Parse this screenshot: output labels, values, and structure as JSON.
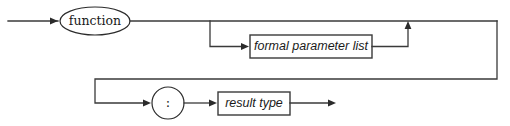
{
  "diagram": {
    "kind": "railroad-syntax-diagram",
    "canvas": {
      "width": 510,
      "height": 126,
      "background": "#ffffff"
    },
    "stroke_color": "#3a3a3a",
    "text_color": "#1a1a1a",
    "nodes": {
      "keyword_function": {
        "label": "function",
        "shape": "oval",
        "type": "terminal",
        "cx": 95,
        "cy": 21,
        "rx": 35,
        "ry": 14
      },
      "formal_parameter_list": {
        "label": "formal parameter list",
        "shape": "rect",
        "type": "nonterminal",
        "x": 250,
        "y": 35,
        "width": 122,
        "height": 23
      },
      "colon": {
        "label": ":",
        "shape": "circle",
        "type": "terminal",
        "cx": 168,
        "cy": 103,
        "r": 16
      },
      "result_type": {
        "label": "result type",
        "shape": "rect",
        "type": "nonterminal",
        "x": 218,
        "y": 92,
        "width": 72,
        "height": 23
      }
    },
    "edges": [
      {
        "name": "entry-line",
        "from": "start",
        "to": "keyword_function"
      },
      {
        "name": "function-to-branch",
        "from": "keyword_function",
        "to": "branch-point"
      },
      {
        "name": "optional-params-bypass",
        "from": "branch-point",
        "to": "merge-point"
      },
      {
        "name": "branch-down-to-params",
        "from": "branch-point",
        "to": "formal_parameter_list"
      },
      {
        "name": "params-up-to-merge",
        "from": "formal_parameter_list",
        "to": "merge-point"
      },
      {
        "name": "wrap-right-down",
        "from": "merge-point",
        "to": "row2-start"
      },
      {
        "name": "row2-down-to-colon",
        "from": "row2-start",
        "to": "colon"
      },
      {
        "name": "colon-to-result-type",
        "from": "colon",
        "to": "result_type"
      },
      {
        "name": "exit-line",
        "from": "result_type",
        "to": "end"
      }
    ]
  }
}
